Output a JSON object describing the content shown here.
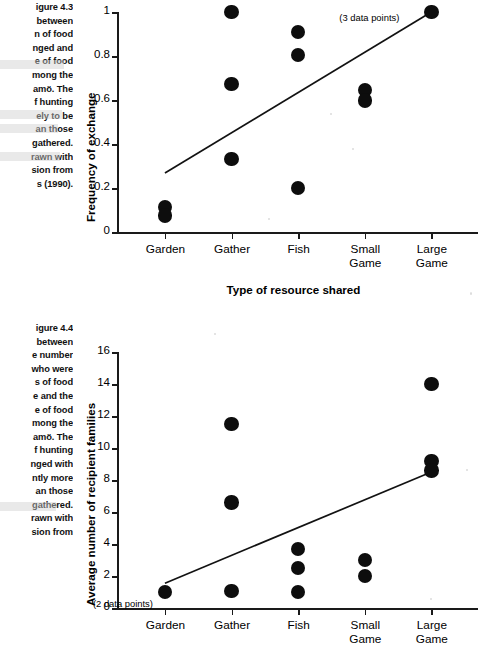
{
  "figures": [
    {
      "caption": {
        "title": "igure 4.3",
        "lines": [
          "between",
          "n of food",
          "nged and",
          "e of food",
          "mong the",
          "amö. The",
          "f hunting",
          "ely to be",
          "an those",
          "gathered.",
          "rawn with",
          "sion from",
          "s (1990)."
        ]
      },
      "chart_data": {
        "type": "scatter",
        "title": "",
        "xlabel": "Type of resource shared",
        "ylabel": "Frequency of exchange",
        "categories": [
          "Garden",
          "Gather",
          "Fish",
          "Small\nGame",
          "Large\nGame"
        ],
        "ytick_labels": [
          "0",
          "0.2",
          "0.4",
          "0.6",
          "0.8",
          "1"
        ],
        "ylim": [
          0,
          1
        ],
        "grid": false,
        "legend": "none",
        "annotations": [
          {
            "text": "(3 data points)",
            "x": "Large Game",
            "y": 1.0
          }
        ],
        "points": [
          {
            "category": "Garden",
            "values": [
              0.115,
              0.075
            ]
          },
          {
            "category": "Gather",
            "values": [
              1.0,
              0.672,
              0.332
            ]
          },
          {
            "category": "Fish",
            "values": [
              0.908,
              0.805,
              0.2
            ]
          },
          {
            "category": "Small Game",
            "values": [
              0.645,
              0.598
            ]
          },
          {
            "category": "Large Game",
            "values": [
              1.0
            ]
          }
        ],
        "trendline": {
          "x_start": "Garden",
          "y_start": 0.268,
          "x_end": "Large Game",
          "y_end": 1.0
        }
      }
    },
    {
      "caption": {
        "title": "igure 4.4",
        "lines": [
          "between",
          "e number",
          "who were",
          "s of food",
          "e and the",
          "e of food",
          "mong the",
          "amö. The",
          "f hunting",
          "nged with",
          "ntly more",
          "an those",
          "gathered.",
          "rawn with",
          "sion from",
          "s (1990)."
        ]
      },
      "chart_data": {
        "type": "scatter",
        "title": "",
        "xlabel": "",
        "ylabel": "Average number of recipient families",
        "categories": [
          "Garden",
          "Gather",
          "Fish",
          "Small\nGame",
          "Large\nGame"
        ],
        "ytick_labels": [
          "0",
          "2",
          "4",
          "6",
          "8",
          "10",
          "12",
          "14",
          "16"
        ],
        "ylim": [
          0,
          16
        ],
        "grid": false,
        "legend": "none",
        "annotations": [
          {
            "text": "(2 data points)",
            "x": "Garden",
            "y": 1.0
          }
        ],
        "points": [
          {
            "category": "Garden",
            "values": [
              1.0
            ]
          },
          {
            "category": "Gather",
            "values": [
              11.5,
              6.6,
              1.05
            ]
          },
          {
            "category": "Fish",
            "values": [
              3.7,
              2.5,
              1.0
            ]
          },
          {
            "category": "Small Game",
            "values": [
              3.0,
              2.0
            ]
          },
          {
            "category": "Large Game",
            "values": [
              14.0,
              9.2,
              8.6
            ]
          }
        ],
        "trendline": {
          "x_start": "Garden",
          "y_start": 1.55,
          "x_end": "Large Game",
          "y_end": 8.5
        }
      }
    }
  ]
}
